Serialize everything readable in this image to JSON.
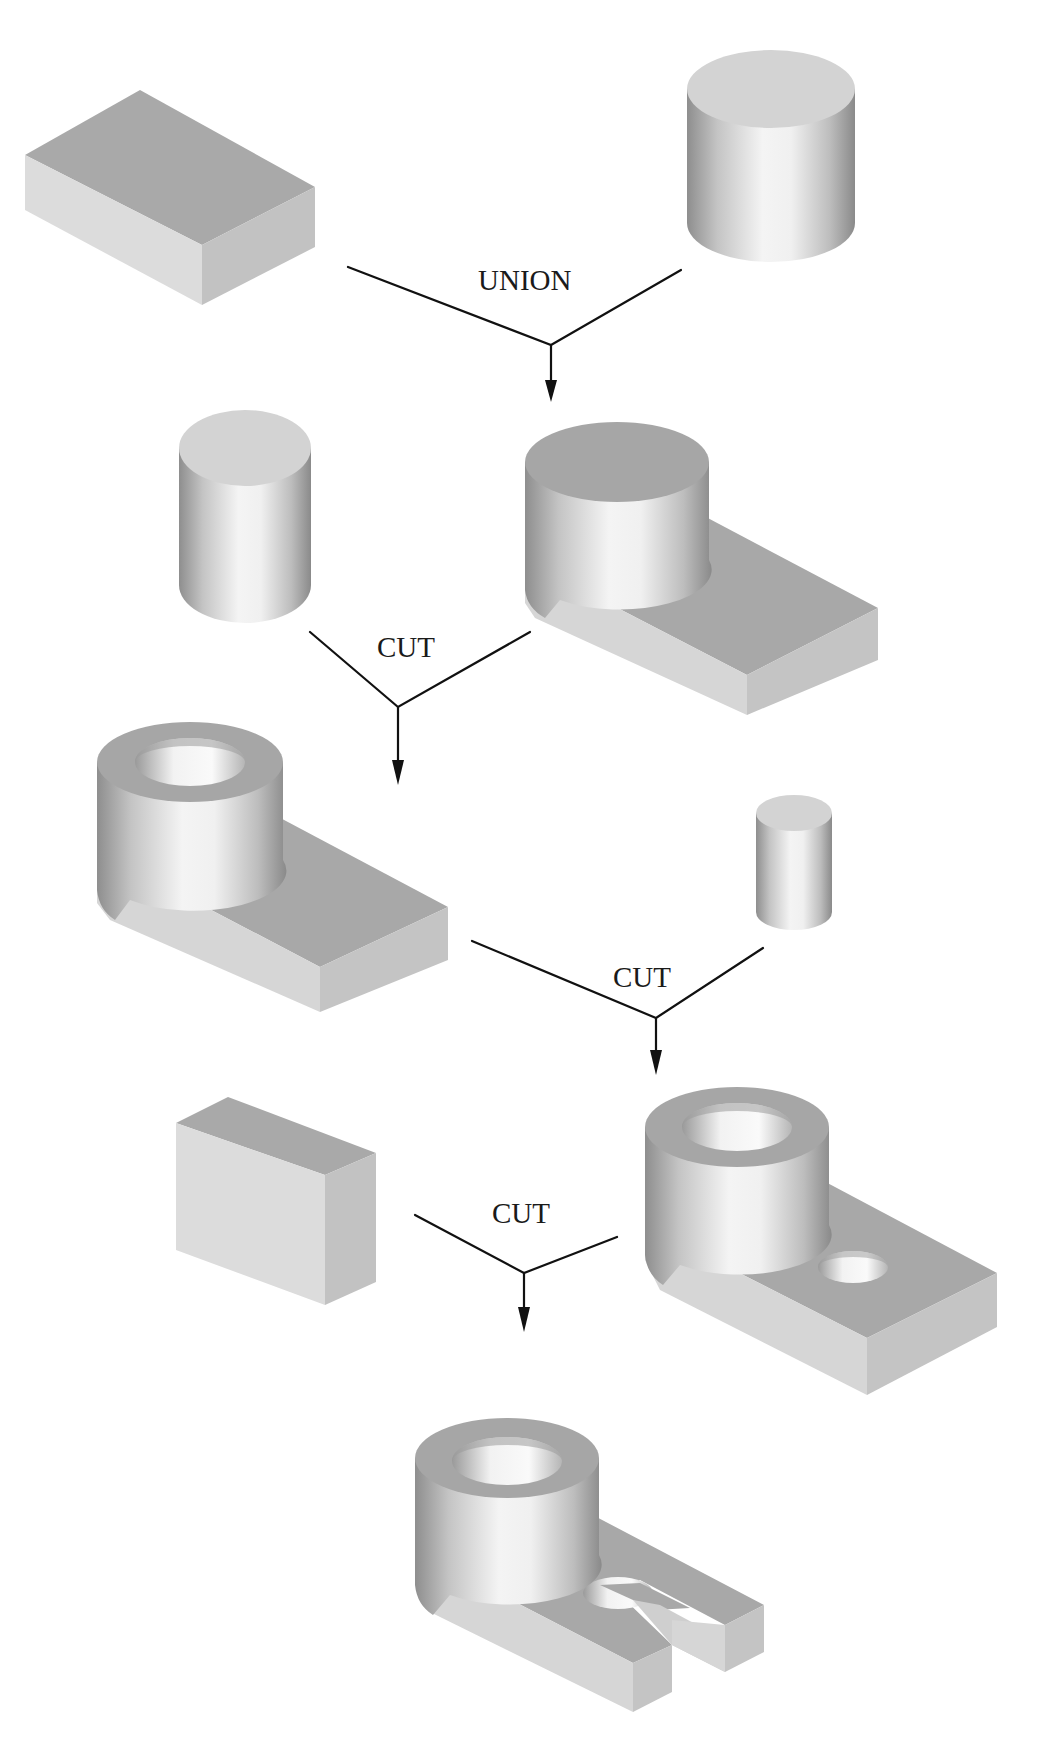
{
  "diagram": {
    "title_fragment": "",
    "colors": {
      "background": "#ffffff",
      "connector": "#111111",
      "top_face": "#a9a9a9",
      "front_face": "#dcdcdc",
      "right_face": "#c2c2c2",
      "cylinder_cap": "#d3d3d3"
    },
    "steps": [
      {
        "operation": "UNION",
        "inputs": [
          "rectangular block",
          "cylinder"
        ],
        "result": "block with cylinder boss"
      },
      {
        "operation": "CUT",
        "inputs": [
          "cylinder",
          "block with cylinder boss"
        ],
        "result": "block with hollow cylinder boss"
      },
      {
        "operation": "CUT",
        "inputs": [
          "block with hollow cylinder boss",
          "small cylinder"
        ],
        "result": "block with hollow boss and through-hole"
      },
      {
        "operation": "CUT",
        "inputs": [
          "rectangular block",
          "block with hollow boss and through-hole"
        ],
        "result": "slotted bracket with hollow boss"
      }
    ],
    "labels": {
      "union": "UNION",
      "cut1": "CUT",
      "cut2": "CUT",
      "cut3": "CUT"
    }
  }
}
